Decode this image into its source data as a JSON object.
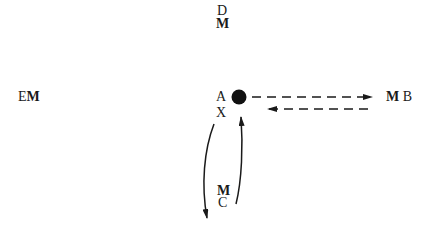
{
  "diagram": {
    "nodes": {
      "D": {
        "letter": "D",
        "marker": "M"
      },
      "E": {
        "letter": "E",
        "marker": "M"
      },
      "A": {
        "letter": "A"
      },
      "X": {
        "letter": "X"
      },
      "B": {
        "marker": "M",
        "letter": "B"
      },
      "C": {
        "marker": "M",
        "letter": "C"
      }
    },
    "edges": [
      {
        "from": "A",
        "to": "B",
        "style": "dashed"
      },
      {
        "from": "B",
        "to": "A",
        "style": "dashed"
      },
      {
        "from": "A",
        "to": "C",
        "style": "solid-curved"
      },
      {
        "from": "C",
        "to": "A",
        "style": "solid-curved"
      }
    ],
    "colors": {
      "ink": "#1a1a1a",
      "background": "#ffffff"
    }
  }
}
